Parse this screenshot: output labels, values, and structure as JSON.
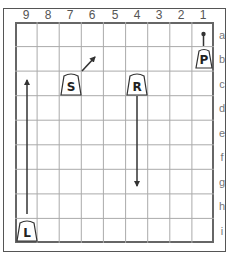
{
  "diagram": {
    "type": "shogi-board",
    "files": [
      "9",
      "8",
      "7",
      "6",
      "5",
      "4",
      "3",
      "2",
      "1"
    ],
    "ranks": [
      "a",
      "b",
      "c",
      "d",
      "e",
      "f",
      "g",
      "h",
      "i"
    ],
    "pieces": [
      {
        "label": "P",
        "name": "pawn",
        "square": "1b"
      },
      {
        "label": "S",
        "name": "silver",
        "square": "7c"
      },
      {
        "label": "R",
        "name": "rook",
        "square": "4c"
      },
      {
        "label": "L",
        "name": "lance",
        "square": "9i",
        "inverted": true
      }
    ],
    "arrows": [
      {
        "piece": "pawn",
        "from": "1b",
        "to": "1a",
        "style": "dot"
      },
      {
        "piece": "silver",
        "from": "7c",
        "to": "6b",
        "style": "arrow"
      },
      {
        "piece": "rook",
        "from": "4c",
        "to": "4g",
        "style": "arrow"
      },
      {
        "piece": "lance",
        "from": "9i",
        "to": "9c",
        "style": "arrow"
      }
    ],
    "colors": {
      "grid": "#aaaaaa",
      "border": "#666666",
      "piece_outline": "#333333",
      "arrow": "#333333",
      "label": "#555555"
    }
  }
}
